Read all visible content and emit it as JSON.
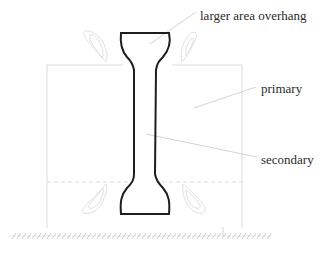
{
  "diagram": {
    "labels": {
      "overhang": "larger area overhang",
      "primary": "primary",
      "secondary": "secondary"
    },
    "colors": {
      "specimen_outline": "#1e1e1e",
      "support_lines": "#d8d8d8",
      "leader_lines": "#d0d0d0",
      "label_text": "#2a2a2a",
      "ground_hatch": "#cfcfcf"
    }
  }
}
